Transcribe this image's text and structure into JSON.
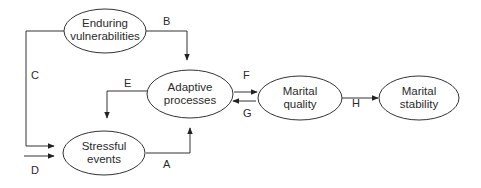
{
  "diagram": {
    "type": "flow-model",
    "nodes": {
      "enduring": {
        "line1": "Enduring",
        "line2": "vulnerabilities"
      },
      "adaptive": {
        "line1": "Adaptive",
        "line2": "processes"
      },
      "stressful": {
        "line1": "Stressful",
        "line2": "events"
      },
      "quality": {
        "line1": "Marital",
        "line2": "quality"
      },
      "stability": {
        "line1": "Marital",
        "line2": "stability"
      }
    },
    "edges": {
      "A": "A",
      "B": "B",
      "C": "C",
      "D": "D",
      "E": "E",
      "F": "F",
      "G": "G",
      "H": "H"
    },
    "connections": [
      {
        "label": "A",
        "from": "Stressful events",
        "to": "Adaptive processes"
      },
      {
        "label": "B",
        "from": "Enduring vulnerabilities",
        "to": "Adaptive processes"
      },
      {
        "label": "C",
        "from": "Enduring vulnerabilities",
        "to": "Stressful events"
      },
      {
        "label": "D",
        "from": "external",
        "to": "Stressful events"
      },
      {
        "label": "E",
        "from": "Adaptive processes",
        "to": "Stressful events"
      },
      {
        "label": "F",
        "from": "Adaptive processes",
        "to": "Marital quality"
      },
      {
        "label": "G",
        "from": "Marital quality",
        "to": "Adaptive processes"
      },
      {
        "label": "H",
        "from": "Marital quality",
        "to": "Marital stability"
      }
    ]
  }
}
